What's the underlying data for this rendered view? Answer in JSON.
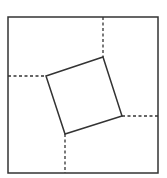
{
  "diagram": {
    "type": "geometric-figure",
    "outer_square": {
      "x1": 8,
      "y1": 17,
      "x2": 158,
      "y2": 173
    },
    "inner_square": {
      "points": [
        [
          46,
          76
        ],
        [
          103,
          57
        ],
        [
          122,
          116
        ],
        [
          65,
          134
        ]
      ]
    },
    "dashed_lines": [
      {
        "x1": 8,
        "y1": 76,
        "x2": 46,
        "y2": 76
      },
      {
        "x1": 103,
        "y1": 17,
        "x2": 103,
        "y2": 57
      },
      {
        "x1": 122,
        "y1": 116,
        "x2": 158,
        "y2": 116
      },
      {
        "x1": 65,
        "y1": 134,
        "x2": 65,
        "y2": 173
      }
    ],
    "colors": {
      "stroke": "#333333",
      "background": "#ffffff"
    }
  }
}
